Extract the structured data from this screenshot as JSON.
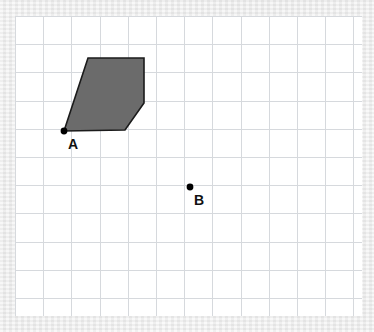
{
  "figure": {
    "type": "geometry-grid-figure",
    "title": "",
    "background_color": "#e9e9e9",
    "canvas": {
      "color": "#ffffff",
      "x": 15,
      "y": 16,
      "width": 347,
      "height": 300
    },
    "grid": {
      "visible": true,
      "cell_size_px": 28.2,
      "line_color": "#d6d9dd",
      "line_width": 1,
      "columns": 12,
      "rows": 10
    },
    "shape": {
      "name": "shaded-pentagon",
      "fill_color": "#6b6b6b",
      "stroke_color": "#1b1b1b",
      "stroke_width": 1.6,
      "vertices": [
        {
          "x": 64,
          "y": 131
        },
        {
          "x": 88,
          "y": 58
        },
        {
          "x": 144,
          "y": 58
        },
        {
          "x": 144,
          "y": 103
        },
        {
          "x": 125,
          "y": 130
        }
      ],
      "vertex_count": 5
    },
    "points": [
      {
        "label": "A",
        "x": 64,
        "y": 131,
        "radius": 3.4,
        "color": "#000000",
        "label_offset": {
          "dx": 4,
          "dy": 6
        }
      },
      {
        "label": "B",
        "x": 190,
        "y": 187,
        "radius": 3.4,
        "color": "#000000",
        "label_offset": {
          "dx": 4,
          "dy": 6
        }
      }
    ]
  },
  "chart_data": {
    "type": "scatter",
    "title": "",
    "xlabel": "",
    "ylabel": "",
    "grid": true,
    "legend": "none",
    "series": [
      {
        "name": "labeled-points",
        "points": [
          {
            "label": "A",
            "x": 64,
            "y": 131
          },
          {
            "label": "B",
            "x": 190,
            "y": 187
          }
        ]
      },
      {
        "name": "shaded-pentagon",
        "points": [
          {
            "x": 64,
            "y": 131
          },
          {
            "x": 88,
            "y": 58
          },
          {
            "x": 144,
            "y": 58
          },
          {
            "x": 144,
            "y": 103
          },
          {
            "x": 125,
            "y": 130
          }
        ]
      }
    ],
    "xlim": [
      15,
      362
    ],
    "ylim": [
      16,
      316
    ]
  }
}
